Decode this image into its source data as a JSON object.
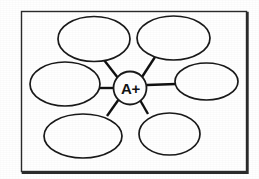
{
  "document": {
    "type": "graphic-organizer",
    "style": "cluster-web-diagram",
    "background_color": "#ffffff",
    "ink_color": "#1a1a1a"
  },
  "frame": {
    "name": "diagram-border",
    "x": 21,
    "y": 11,
    "width": 226,
    "height": 161,
    "stroke_color": "#2b2b2b"
  },
  "center_node": {
    "label": "A+",
    "cx": 130,
    "cy": 88,
    "r": 16.5,
    "fill": "#ffffff",
    "stroke": "#1a1a1a"
  },
  "ovals": [
    {
      "id": "top-left",
      "label": "",
      "cx": 94,
      "cy": 39,
      "rx": 36,
      "ry": 22.5
    },
    {
      "id": "top-right",
      "label": "",
      "cx": 173.5,
      "cy": 38,
      "rx": 36.5,
      "ry": 22
    },
    {
      "id": "left",
      "label": "",
      "cx": 65,
      "cy": 84,
      "rx": 35,
      "ry": 22
    },
    {
      "id": "right",
      "label": "",
      "cx": 206.5,
      "cy": 81.5,
      "rx": 31.5,
      "ry": 18.5
    },
    {
      "id": "bottom-left",
      "label": "",
      "cx": 83,
      "cy": 136,
      "rx": 39,
      "ry": 22
    },
    {
      "id": "bottom-right",
      "label": "",
      "cx": 169.5,
      "cy": 134,
      "rx": 30.5,
      "ry": 21
    }
  ],
  "connectors": [
    {
      "id": "center-to-top-left",
      "x1": 118,
      "y1": 78,
      "x2": 104,
      "y2": 60
    },
    {
      "id": "center-to-top-right",
      "x1": 142,
      "y1": 77,
      "x2": 155,
      "y2": 57
    },
    {
      "id": "center-to-left",
      "x1": 113,
      "y1": 88,
      "x2": 99,
      "y2": 88
    },
    {
      "id": "center-to-right",
      "x1": 147,
      "y1": 85,
      "x2": 176,
      "y2": 84
    },
    {
      "id": "center-to-bottom-left",
      "x1": 119,
      "y1": 99,
      "x2": 107,
      "y2": 116
    },
    {
      "id": "center-to-bottom-right",
      "x1": 140,
      "y1": 100,
      "x2": 148,
      "y2": 114
    }
  ]
}
